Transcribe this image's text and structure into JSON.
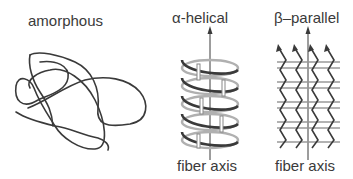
{
  "panels": [
    {
      "title": "amorphous"
    },
    {
      "title": "α-helical",
      "axis_label": "fiber axis"
    },
    {
      "title": "β–parallel",
      "axis_label": "fiber axis"
    }
  ],
  "colors": {
    "line": "#3a3a3a",
    "light": "#a8a8a8"
  }
}
